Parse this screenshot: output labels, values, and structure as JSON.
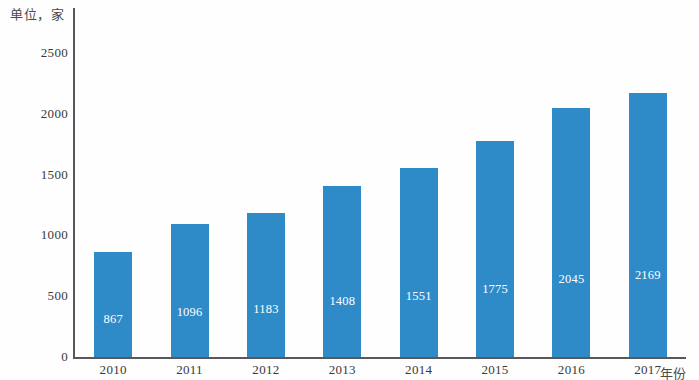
{
  "unit_caption": "单位，家",
  "axis_title_x": "年份",
  "chart_data": {
    "type": "bar",
    "title": "",
    "subtitle": "",
    "xlabel": "年份",
    "ylabel": "单位，家",
    "categories": [
      "2010",
      "2011",
      "2012",
      "2013",
      "2014",
      "2015",
      "2016",
      "2017"
    ],
    "values": [
      867,
      1096,
      1183,
      1408,
      1551,
      1775,
      2045,
      2169
    ],
    "data_labels": [
      "867",
      "1096",
      "1183",
      "1408",
      "1551",
      "1775",
      "2045",
      "2169"
    ],
    "ylim": [
      0,
      2500
    ],
    "y_ticks": [
      0,
      500,
      1000,
      1500,
      2000,
      2500
    ],
    "y_tick_labels": [
      "0",
      "500",
      "1000",
      "1500",
      "2000",
      "2500"
    ],
    "grid": false,
    "legend": false,
    "legend_position": "none",
    "series": [
      {
        "name": "家数",
        "values": [
          867,
          1096,
          1183,
          1408,
          1551,
          1775,
          2045,
          2169
        ],
        "color": "#2e8bc8"
      }
    ],
    "colors": {
      "bar": "#2e8bc8",
      "axis": "#58585a",
      "data_label": "#ffffff",
      "tick_label": "#39393b",
      "background": "#ffffff"
    }
  }
}
